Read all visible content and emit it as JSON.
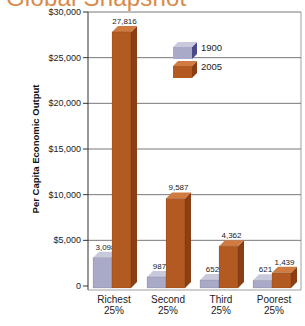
{
  "title": "Global Snapshot",
  "colors": {
    "series_1900_front": "#a9a9c8",
    "series_1900_top": "#c9c9de",
    "series_1900_side": "#4b4b8c",
    "series_2005_front": "#b35a22",
    "series_2005_top": "#cf7b42",
    "series_2005_side": "#8a3f14",
    "title": "#d98a4a",
    "grid": "#555555"
  },
  "chart_data": {
    "type": "bar",
    "title": "Global Snapshot",
    "xlabel": "",
    "ylabel": "Per Capita Economic Output",
    "categories": [
      "Richest 25%",
      "Second 25%",
      "Third 25%",
      "Poorest 25%"
    ],
    "category_lines": [
      [
        "Richest",
        "25%"
      ],
      [
        "Second",
        "25%"
      ],
      [
        "Third",
        "25%"
      ],
      [
        "Poorest",
        "25%"
      ]
    ],
    "series": [
      {
        "name": "1900",
        "values": [
          3098,
          987,
          652,
          621
        ],
        "labels": [
          "3,098",
          "987",
          "652",
          "621"
        ]
      },
      {
        "name": "2005",
        "values": [
          27816,
          9587,
          4362,
          1439
        ],
        "labels": [
          "27,816",
          "9,587",
          "4,362",
          "1,439"
        ]
      }
    ],
    "ylim": [
      0,
      30000
    ],
    "yticks": [
      0,
      5000,
      10000,
      15000,
      20000,
      25000,
      30000
    ],
    "ytick_labels": [
      "0",
      "$5,000",
      "$10,000",
      "$15,000",
      "$20,000",
      "$25,000",
      "$30,000"
    ],
    "grid": true,
    "legend_position": "upper center, inside plot",
    "style": "3d bars"
  }
}
